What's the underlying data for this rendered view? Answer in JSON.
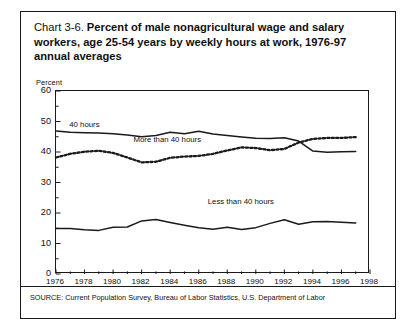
{
  "figure": {
    "chart_number": "Chart 3-6.",
    "title": "Percent of male nonagricultural wage and salary workers, age 25-54 years by weekly hours at work, 1976-97 annual averages",
    "y_axis_title": "Percent",
    "source_note": "SOURCE: Current Population Survey, Bureau of Labor Statistics, U.S. Department of Labor"
  },
  "chart_data": {
    "type": "line",
    "title": "Chart 3-6. Percent of male nonagricultural wage and salary workers, age 25-54 years by weekly hours at work, 1976-97 annual averages",
    "xlabel": "",
    "ylabel": "Percent",
    "xlim": [
      1976,
      1998
    ],
    "ylim": [
      0,
      60
    ],
    "ytick_values": [
      0,
      10,
      20,
      30,
      40,
      50,
      60
    ],
    "ytick_labels": [
      "0",
      "10",
      "20",
      "30",
      "40",
      "50",
      "60"
    ],
    "xtick_values": [
      1976,
      1978,
      1980,
      1982,
      1984,
      1986,
      1988,
      1990,
      1992,
      1994,
      1996,
      1998
    ],
    "xtick_labels": [
      "1976",
      "1978",
      "1980",
      "1982",
      "1984",
      "1986",
      "1988",
      "1990",
      "1992",
      "1994",
      "1996",
      "1998"
    ],
    "grid": false,
    "legend_position": "inline-annotations",
    "x": [
      1976,
      1977,
      1978,
      1979,
      1980,
      1981,
      1982,
      1983,
      1984,
      1985,
      1986,
      1987,
      1988,
      1989,
      1990,
      1991,
      1992,
      1993,
      1994,
      1995,
      1996,
      1997
    ],
    "series": [
      {
        "name": "40 hours",
        "style": "solid",
        "color": "#1a1a1a",
        "label_text": "40 hours",
        "values": [
          46.9,
          46.5,
          46.3,
          46.2,
          46.0,
          45.6,
          45.0,
          45.4,
          46.5,
          46.0,
          46.8,
          45.9,
          45.4,
          44.9,
          44.5,
          44.4,
          44.7,
          43.6,
          40.3,
          39.9,
          40.1,
          40.2
        ]
      },
      {
        "name": "More than 40 hours",
        "style": "dotted",
        "color": "#1a1a1a",
        "label_text": "More than 40 hours",
        "values": [
          38.2,
          39.4,
          40.1,
          40.4,
          39.7,
          38.2,
          36.6,
          36.8,
          38.1,
          38.5,
          38.7,
          39.4,
          40.5,
          41.5,
          41.3,
          40.6,
          41.0,
          43.1,
          44.3,
          44.6,
          44.6,
          44.9
        ]
      },
      {
        "name": "Less than 40 hours",
        "style": "solid",
        "color": "#1a1a1a",
        "label_text": "Less than 40 hours",
        "values": [
          14.9,
          14.9,
          14.5,
          14.3,
          15.3,
          15.4,
          17.4,
          17.9,
          16.9,
          16.0,
          15.2,
          14.7,
          15.3,
          14.6,
          15.2,
          16.6,
          17.8,
          16.3,
          17.1,
          17.2,
          17.0,
          16.7
        ]
      }
    ],
    "annotations": [
      {
        "text": "40 hours",
        "x": 1977.0,
        "y": 50.3
      },
      {
        "text": "More than 40 hours",
        "x": 1981.5,
        "y": 45.2
      },
      {
        "text": "Less than 40 hours",
        "x": 1986.7,
        "y": 25.0
      }
    ]
  }
}
